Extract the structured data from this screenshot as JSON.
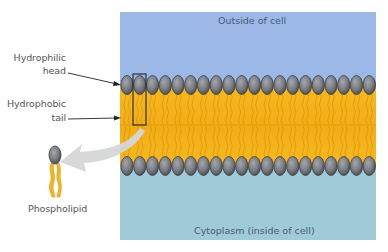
{
  "diagram": {
    "regions": {
      "outside": {
        "label": "Outside of cell",
        "color": "#9bb8e6"
      },
      "inside": {
        "label": "Cytoplasm (inside of cell)",
        "color": "#9fcbd6"
      }
    },
    "labels": {
      "hydrophilic_line1": "Hydrophilic",
      "hydrophilic_line2": "head",
      "hydrophobic_line1": "Hydrophobic",
      "hydrophobic_line2": "tail",
      "phospholipid": "Phospholipid"
    },
    "colors": {
      "head_fill": "#7d7f86",
      "head_stroke": "#3c3d42",
      "tail_fill": "#f5b51e",
      "tail_line": "#c98a10",
      "arrow_gray": "#d4d6d8",
      "pointer": "#222222",
      "highlight_box": "#2a2f3a"
    },
    "heads_per_row": 20
  }
}
